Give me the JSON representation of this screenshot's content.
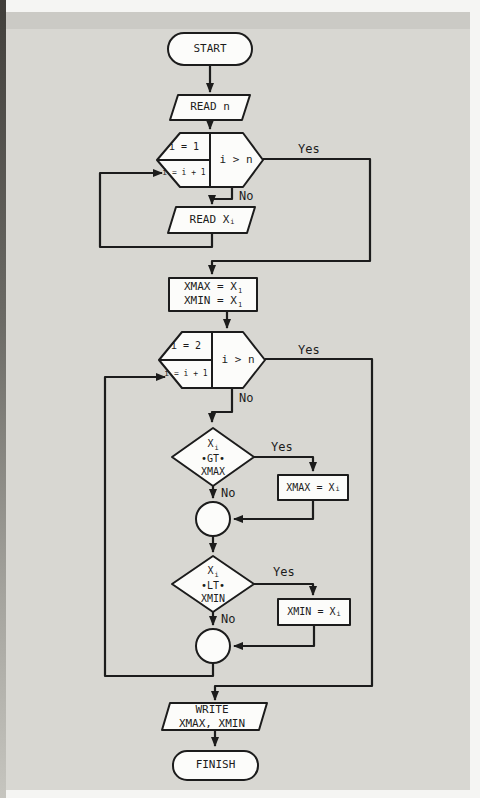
{
  "colors": {
    "paper": "#d8d7d2",
    "ink": "#1c1c1c",
    "node_fill": "#fcfcfa"
  },
  "nodes": {
    "start": {
      "label": "START"
    },
    "read_n": {
      "label": "READ n"
    },
    "loop1": {
      "init": "i = 1",
      "incr": "i = i + 1",
      "test": "i > n"
    },
    "read_x": {
      "base": "READ X",
      "sub": "i"
    },
    "init_box": {
      "line1_base": "XMAX = X",
      "line1_sub": "1",
      "line2_base": "XMIN = X",
      "line2_sub": "1"
    },
    "loop2": {
      "init": "i = 2",
      "incr": "i = i + 1",
      "test": "i > n"
    },
    "gt_diamond": {
      "base": "X",
      "sub": "i",
      "op": "•GT•",
      "operand": "XMAX"
    },
    "set_xmax": {
      "base": "XMAX = X",
      "sub": "i"
    },
    "lt_diamond": {
      "base": "X",
      "sub": "i",
      "op": "•LT•",
      "operand": "XMIN"
    },
    "set_xmin": {
      "base": "XMIN = X",
      "sub": "i"
    },
    "write": {
      "line1": "WRITE",
      "line2": "XMAX, XMIN"
    },
    "finish": {
      "label": "FINISH"
    }
  },
  "edges": {
    "loop1_yes": "Yes",
    "loop1_no": "No",
    "loop2_yes": "Yes",
    "loop2_no": "No",
    "gt_yes": "Yes",
    "gt_no": "No",
    "lt_yes": "Yes",
    "lt_no": "No"
  }
}
